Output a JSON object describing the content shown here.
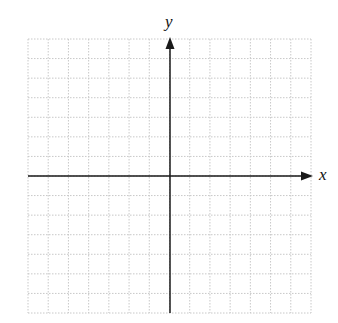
{
  "diagram": {
    "type": "coordinate-plane",
    "x_axis_label": "x",
    "y_axis_label": "y",
    "grid": {
      "columns": 14,
      "rows": 14,
      "left": 28,
      "top": 39,
      "right": 311,
      "bottom": 313,
      "line_style": "dotted",
      "line_color": "#c8c8c8"
    },
    "axes": {
      "origin_x": 170,
      "origin_y": 176,
      "color": "#1a1a1a",
      "x_arrow_tip": 313,
      "y_arrow_tip": 37
    }
  }
}
